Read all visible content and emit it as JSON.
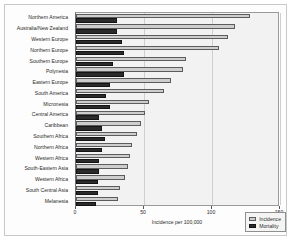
{
  "chart_data": {
    "type": "bar",
    "orientation": "horizontal",
    "title": "",
    "xlabel": "Incidence per 100,000",
    "ylabel": "",
    "xlim": [
      0,
      150
    ],
    "xticks": [
      0,
      50,
      100,
      150
    ],
    "xtick_labels": [
      "0",
      "50",
      "100",
      "150"
    ],
    "grid": true,
    "legend_position": "bottom-right",
    "categories": [
      "Northern America",
      "Australia/New Zealand",
      "Western Europe",
      "Northern Europe",
      "Southern Europe",
      "Polynesia",
      "Eastern Europe",
      "South America",
      "Micronesia",
      "Central America",
      "Caribbean",
      "Southern Africa",
      "Northern Africa",
      "Western Africa",
      "South-Eastern Asia",
      "Western Africa",
      "South Central Asia",
      "Melanesia"
    ],
    "series": [
      {
        "name": "Incidence",
        "color": "#cdcdcd",
        "values": [
          128,
          117,
          112,
          105,
          81,
          79,
          70,
          65,
          54,
          51,
          48,
          45,
          41,
          40,
          38,
          36,
          32,
          31
        ]
      },
      {
        "name": "Mortality",
        "color": "#2b2b2b",
        "values": [
          30,
          30,
          34,
          35,
          27,
          35,
          25,
          22,
          25,
          17,
          19,
          21,
          19,
          17,
          17,
          16,
          16,
          15
        ]
      }
    ]
  },
  "legend": {
    "items": [
      {
        "label": "Incidence",
        "key": "incidence"
      },
      {
        "label": "Mortality",
        "key": "mortality"
      }
    ]
  },
  "axis": {
    "x_title": "Incidence per 100,000"
  }
}
